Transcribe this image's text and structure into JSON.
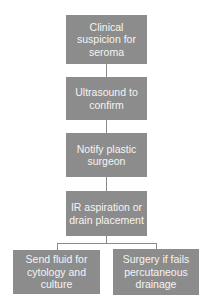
{
  "flowchart": {
    "nodes": [
      {
        "id": "n1",
        "label": "Clinical suspicion for seroma"
      },
      {
        "id": "n2",
        "label": "Ultrasound to confirm"
      },
      {
        "id": "n3",
        "label": "Notify plastic surgeon"
      },
      {
        "id": "n4",
        "label": "IR aspiration or drain placement"
      },
      {
        "id": "n5",
        "label": "Send fluid for cytology and culture"
      },
      {
        "id": "n6",
        "label": "Surgery if fails percutaneous drainage"
      }
    ],
    "edges": [
      {
        "from": "n1",
        "to": "n2"
      },
      {
        "from": "n2",
        "to": "n3"
      },
      {
        "from": "n3",
        "to": "n4"
      },
      {
        "from": "n4",
        "to": "n5"
      },
      {
        "from": "n4",
        "to": "n6"
      }
    ],
    "colors": {
      "box": "#8c8c8c",
      "text": "#f4f4f4",
      "connector": "#8a8a8a"
    }
  }
}
